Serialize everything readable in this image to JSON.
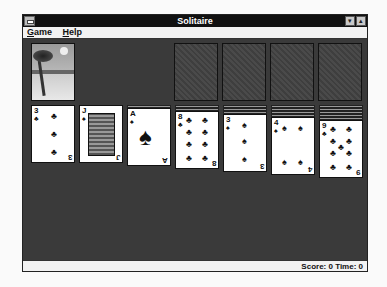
{
  "window": {
    "title": "Solitaire",
    "minimize_label": "▾",
    "maximize_label": "▴"
  },
  "menu": [
    {
      "label": "Game",
      "accel": "G",
      "rest": "ame"
    },
    {
      "label": "Help",
      "accel": "H",
      "rest": "elp"
    }
  ],
  "status": {
    "text": "Score: 0 Time: 0",
    "score": 0,
    "time": 0
  },
  "stock": {
    "back_design": "beach-palm-tree"
  },
  "foundations": [
    "empty",
    "empty",
    "empty",
    "empty"
  ],
  "tableau": [
    {
      "hidden": 0,
      "rank": "3",
      "suit": "♣",
      "suit_name": "clubs"
    },
    {
      "hidden": 0,
      "rank": "J",
      "suit": "♠",
      "suit_name": "spades"
    },
    {
      "hidden": 1,
      "rank": "A",
      "suit": "♠",
      "suit_name": "spades"
    },
    {
      "hidden": 2,
      "rank": "8",
      "suit": "♣",
      "suit_name": "clubs"
    },
    {
      "hidden": 3,
      "rank": "3",
      "suit": "♠",
      "suit_name": "spades"
    },
    {
      "hidden": 4,
      "rank": "4",
      "suit": "♠",
      "suit_name": "spades"
    },
    {
      "hidden": 5,
      "rank": "9",
      "suit": "♣",
      "suit_name": "clubs"
    }
  ]
}
